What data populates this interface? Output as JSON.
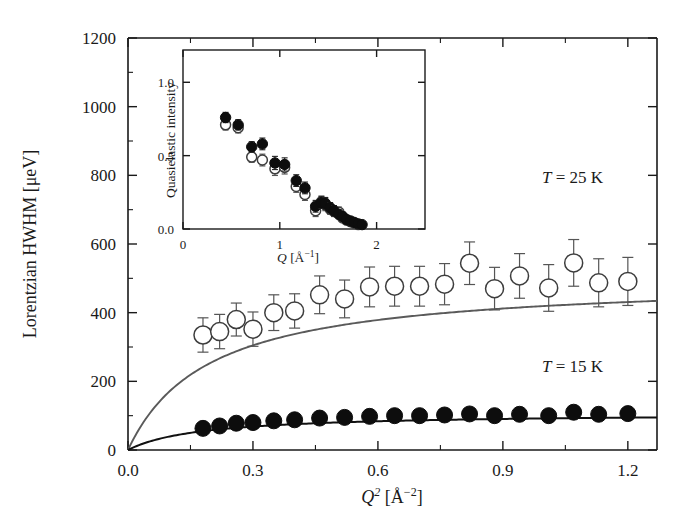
{
  "chart_data": [
    {
      "id": "main",
      "type": "scatter",
      "title": "",
      "xlabel": "Q² [Å⁻²]",
      "ylabel": "Lorentzian HWHM [μeV]",
      "xlim": [
        0.0,
        1.27
      ],
      "ylim": [
        0,
        1200
      ],
      "grid": false,
      "legend_position": "inline-annotation",
      "xticks": [
        0.0,
        0.3,
        0.6,
        0.9,
        1.2
      ],
      "xticklabels": [
        "0.0",
        "0.3",
        "0.6",
        "0.9",
        "1.2"
      ],
      "xticks_minor": [
        0.15,
        0.45,
        0.75,
        1.05
      ],
      "yticks": [
        0,
        200,
        400,
        600,
        800,
        1000,
        1200
      ],
      "yticklabels": [
        "0",
        "200",
        "400",
        "600",
        "800",
        "1000",
        "1200"
      ],
      "yticks_minor": [
        100,
        300,
        500,
        700,
        900,
        1100
      ],
      "annotations": [
        {
          "text": "T = 25 K",
          "x": 0.92,
          "y": 700,
          "italic_prefix": "T",
          "rest": " = 25 K"
        },
        {
          "text": "T = 15 K",
          "x": 0.92,
          "y": 245,
          "italic_prefix": "T",
          "rest": " = 15 K"
        }
      ],
      "series": [
        {
          "name": "T = 25 K",
          "marker": "open-circle",
          "marker_size": 9,
          "color": "#3d3d3d",
          "x": [
            0.18,
            0.22,
            0.26,
            0.3,
            0.35,
            0.4,
            0.46,
            0.52,
            0.58,
            0.64,
            0.7,
            0.76,
            0.82,
            0.88,
            0.94,
            1.01,
            1.07,
            1.13,
            1.2
          ],
          "y": [
            335,
            345,
            380,
            352,
            400,
            405,
            452,
            440,
            475,
            477,
            477,
            483,
            544,
            470,
            507,
            472,
            545,
            487,
            491
          ],
          "yerr": [
            50,
            50,
            48,
            50,
            52,
            50,
            55,
            55,
            58,
            58,
            58,
            60,
            62,
            62,
            65,
            68,
            68,
            70,
            70
          ],
          "fit_curve": {
            "model": "jump-diffusion",
            "description": "HWHM = D*Q^2 / (1 + D*Q^2*tau)",
            "asymptote": 500,
            "initial_slope": 2600
          }
        },
        {
          "name": "T = 15 K",
          "marker": "filled-circle",
          "marker_size": 8,
          "color": "#0d0d0d",
          "x": [
            0.18,
            0.22,
            0.26,
            0.3,
            0.35,
            0.4,
            0.46,
            0.52,
            0.58,
            0.64,
            0.7,
            0.76,
            0.82,
            0.88,
            0.94,
            1.01,
            1.07,
            1.13,
            1.2
          ],
          "y": [
            63,
            70,
            78,
            80,
            85,
            88,
            93,
            95,
            98,
            100,
            100,
            102,
            105,
            100,
            104,
            100,
            110,
            104,
            106
          ],
          "yerr": [
            0,
            0,
            0,
            0,
            0,
            0,
            0,
            0,
            0,
            0,
            0,
            0,
            0,
            0,
            0,
            0,
            0,
            0,
            0
          ],
          "fit_curve": {
            "model": "jump-diffusion",
            "description": "HWHM = D*Q^2 / (1 + D*Q^2*tau)",
            "asymptote": 108,
            "initial_slope": 620
          }
        }
      ]
    },
    {
      "id": "inset",
      "type": "scatter",
      "title": "",
      "xlabel": "Q [Å⁻¹]",
      "ylabel": "Quasielastic intensity",
      "xlim": [
        0,
        2.5
      ],
      "ylim": [
        0.0,
        1.22
      ],
      "grid": false,
      "xticks": [
        0,
        1,
        2
      ],
      "xticklabels": [
        "0",
        "1",
        "2"
      ],
      "yticks": [
        0.0,
        0.5,
        1.0
      ],
      "yticklabels": [
        "0.0",
        "0.5",
        "1.0"
      ],
      "series": [
        {
          "name": "filled",
          "marker": "filled-circle",
          "marker_size": 5.2,
          "color": "#0d0d0d",
          "x": [
            0.44,
            0.57,
            0.71,
            0.82,
            0.95,
            1.05,
            1.17,
            1.26,
            1.37,
            1.43,
            1.47,
            1.52,
            1.56,
            1.61,
            1.65,
            1.69,
            1.73,
            1.77,
            1.81,
            1.85
          ],
          "y": [
            0.76,
            0.71,
            0.56,
            0.58,
            0.45,
            0.44,
            0.33,
            0.28,
            0.155,
            0.18,
            0.175,
            0.145,
            0.125,
            0.1,
            0.085,
            0.065,
            0.055,
            0.045,
            0.035,
            0.03
          ],
          "yerr": [
            0.035,
            0.035,
            0.035,
            0.04,
            0.045,
            0.045,
            0.04,
            0.04,
            0.04,
            0.04,
            0.04,
            0.035,
            0.035,
            0.03,
            0.03,
            0.025,
            0.025,
            0.02,
            0.02,
            0.02
          ]
        },
        {
          "name": "open",
          "marker": "open-circle",
          "marker_size": 5.0,
          "color": "#3d3d3d",
          "x": [
            0.44,
            0.57,
            0.71,
            0.82,
            0.95,
            1.05,
            1.17,
            1.26,
            1.37,
            1.43,
            1.47,
            1.52,
            1.56,
            1.61,
            1.65,
            1.69,
            1.73,
            1.77,
            1.81
          ],
          "y": [
            0.71,
            0.69,
            0.49,
            0.47,
            0.41,
            0.42,
            0.29,
            0.235,
            0.125,
            0.185,
            0.165,
            0.135,
            0.12,
            0.115,
            0.075,
            0.06,
            0.05,
            0.04,
            0.03
          ],
          "yerr": [
            0.035,
            0.035,
            0.035,
            0.04,
            0.045,
            0.045,
            0.04,
            0.04,
            0.04,
            0.04,
            0.04,
            0.035,
            0.035,
            0.035,
            0.03,
            0.025,
            0.025,
            0.02,
            0.02
          ]
        }
      ]
    }
  ],
  "figure": {
    "background": "#ffffff",
    "axis_color": "#1a1a1a",
    "open_series_color": "#5a5a5a",
    "filled_series_color": "#0d0d0d"
  }
}
